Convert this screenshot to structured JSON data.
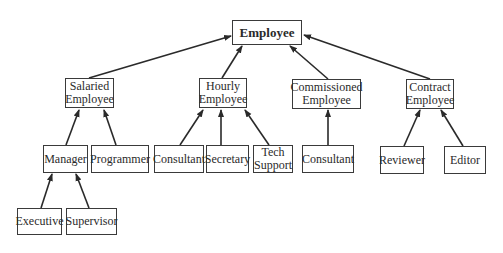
{
  "diagram": {
    "nodes": {
      "employee": {
        "label": "Employee"
      },
      "salaried": {
        "label": "Salaried\nEmployee"
      },
      "hourly": {
        "label": "Hourly\nEmployee"
      },
      "commissioned": {
        "label": "Commissioned\nEmployee"
      },
      "contract": {
        "label": "Contract\nEmployee"
      },
      "manager": {
        "label": "Manager"
      },
      "programmer": {
        "label": "Programmer"
      },
      "consultant_hourly": {
        "label": "Consultant"
      },
      "secretary": {
        "label": "Secretary"
      },
      "tech_support": {
        "label": "Tech\nSupport"
      },
      "consultant_commissioned": {
        "label": "Consultant"
      },
      "reviewer": {
        "label": "Reviewer"
      },
      "editor": {
        "label": "Editor"
      },
      "executive": {
        "label": "Executive"
      },
      "supervisor": {
        "label": "Supervisor"
      }
    },
    "edges": [
      {
        "from": "salaried",
        "to": "employee"
      },
      {
        "from": "hourly",
        "to": "employee"
      },
      {
        "from": "commissioned",
        "to": "employee"
      },
      {
        "from": "contract",
        "to": "employee"
      },
      {
        "from": "manager",
        "to": "salaried"
      },
      {
        "from": "programmer",
        "to": "salaried"
      },
      {
        "from": "consultant_hourly",
        "to": "hourly"
      },
      {
        "from": "secretary",
        "to": "hourly"
      },
      {
        "from": "tech_support",
        "to": "hourly"
      },
      {
        "from": "consultant_commissioned",
        "to": "commissioned"
      },
      {
        "from": "reviewer",
        "to": "contract"
      },
      {
        "from": "editor",
        "to": "contract"
      },
      {
        "from": "executive",
        "to": "manager"
      },
      {
        "from": "supervisor",
        "to": "manager"
      }
    ],
    "colors": {
      "line": "#2a2a2a",
      "border": "#3a3a3a",
      "background": "#ffffff"
    }
  }
}
